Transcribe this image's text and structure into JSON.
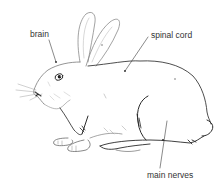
{
  "diagram": {
    "labels": {
      "brain": "brain",
      "spinal_cord": "spinal cord",
      "main_nerves": "main nerves"
    },
    "colors": {
      "line": "#2a2a2a",
      "outline_light": "#8a8a8a",
      "text": "#333333",
      "background": "#ffffff"
    }
  }
}
